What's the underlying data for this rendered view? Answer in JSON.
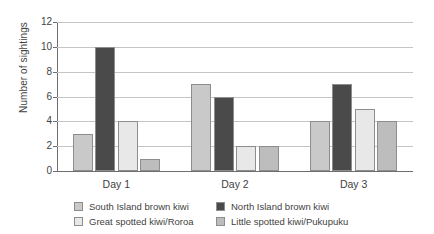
{
  "chart_data": {
    "type": "bar",
    "title": "",
    "subtitle": "",
    "xlabel": "",
    "ylabel": "Number of sightings",
    "categories": [
      "Day 1",
      "Day 2",
      "Day 3"
    ],
    "ylim": [
      0,
      12
    ],
    "ytick_labels": [
      "0",
      "2",
      "4",
      "6",
      "8",
      "10",
      "12"
    ],
    "ytick_values": [
      0,
      2,
      4,
      6,
      8,
      10,
      12
    ],
    "grid": true,
    "legend_position": "bottom",
    "series": [
      {
        "name": "South Island brown kiwi",
        "color": "#c9c9c9",
        "values": [
          3,
          7,
          4
        ]
      },
      {
        "name": "North Island brown kiwi",
        "color": "#4a4a4a",
        "values": [
          10,
          6,
          7
        ]
      },
      {
        "name": "Great spotted kiwi/Roroa",
        "color": "#e8e8e8",
        "values": [
          4,
          2,
          5
        ]
      },
      {
        "name": "Little spotted kiwi/Pukupuku",
        "color": "#bdbdbd",
        "values": [
          1,
          2,
          4
        ]
      }
    ]
  },
  "axes": {
    "y_title": "Number of sightings",
    "bar_border_color": "#8d8d8d",
    "grid_color": "#c4c4c4",
    "axis_color": "#6e6e6e",
    "text_color": "#3f3f3f"
  }
}
